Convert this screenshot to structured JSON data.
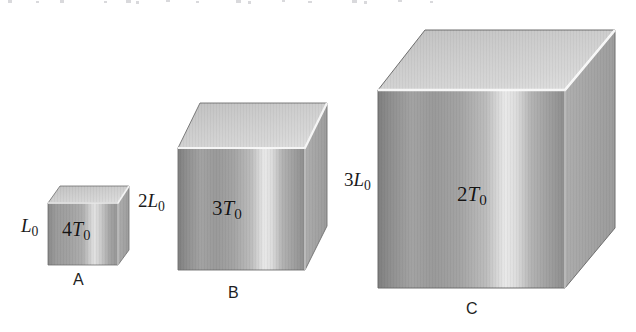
{
  "figure": {
    "background_color": "#ffffff",
    "cubes": [
      {
        "id": "A",
        "caption": "A",
        "edge_label_prefix": "",
        "edge_label_var": "L",
        "edge_label_sub": "0",
        "edge_label_full": "L0",
        "face_label_prefix": "4",
        "face_label_var": "T",
        "face_label_sub": "0",
        "face_label_full": "4T0",
        "relative_size": 1
      },
      {
        "id": "B",
        "caption": "B",
        "edge_label_prefix": "2",
        "edge_label_var": "L",
        "edge_label_sub": "0",
        "edge_label_full": "2L0",
        "face_label_prefix": "3",
        "face_label_var": "T",
        "face_label_sub": "0",
        "face_label_full": "3T0",
        "relative_size": 2
      },
      {
        "id": "C",
        "caption": "C",
        "edge_label_prefix": "3",
        "edge_label_var": "L",
        "edge_label_sub": "0",
        "edge_label_full": "3L0",
        "face_label_prefix": "2",
        "face_label_var": "T",
        "face_label_sub": "0",
        "face_label_full": "2T0",
        "relative_size": 3
      }
    ],
    "colors": {
      "front_dark": "#8e8e8e",
      "front_mid": "#a6a6a6",
      "front_highlight": "#e6e6e6",
      "top_face": "#cfcfcf",
      "side_face": "#a9a9a9",
      "edge_highlight": "#fbfbfb",
      "outline": "#6f6f6f",
      "text": "#141414"
    }
  }
}
